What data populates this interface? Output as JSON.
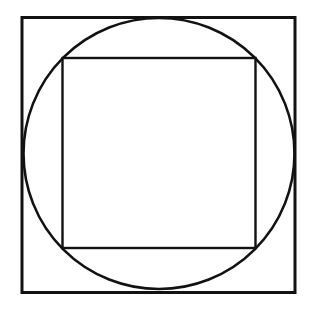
{
  "canvas": {
    "width": 313,
    "height": 311,
    "background_color": "#ffffff",
    "description": "Black line geometric drawing on plain white background: a square, a circle inscribed in that square, and a second smaller square inscribed in the circle."
  },
  "figure": {
    "stroke_color": "#121212",
    "fill_color": "none",
    "shape_count": 3,
    "shapes": [
      {
        "name": "outer-square",
        "type": "square",
        "x": 22,
        "y": 17.5,
        "width": 273,
        "height": 275,
        "stroke_width": 3,
        "label": "Outer square"
      },
      {
        "name": "inscribed-circle",
        "type": "circle",
        "cx": 159,
        "cy": 153.5,
        "r": 135.5,
        "stroke_width": 2.6,
        "label": "Circle inscribed in outer square"
      },
      {
        "name": "inner-square",
        "type": "square",
        "x": 62.5,
        "y": 58,
        "width": 193,
        "height": 190,
        "stroke_width": 2.4,
        "label": "Square inscribed in circle"
      }
    ]
  }
}
